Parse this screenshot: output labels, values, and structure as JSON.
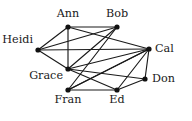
{
  "figure": {
    "background_color": "#ffffff",
    "edge_color": "#1a1a1a",
    "vertex_color": "#111111",
    "label_color": "#1a1a1a"
  },
  "chart_data": {
    "type": "diagram",
    "subtype": "node-link-graph",
    "directed": false,
    "title": "",
    "xlabel": "",
    "ylabel": "",
    "grid": false,
    "legend": "none",
    "nodes": [
      {
        "id": "ann",
        "label": "Ann",
        "x": 68,
        "y": 27,
        "label_x": 68,
        "label_y": 17,
        "label_anchor": "middle"
      },
      {
        "id": "bob",
        "label": "Bob",
        "x": 117,
        "y": 27,
        "label_x": 117,
        "label_y": 17,
        "label_anchor": "middle"
      },
      {
        "id": "heidi",
        "label": "Heidi",
        "x": 38,
        "y": 50,
        "label_x": 33,
        "label_y": 43,
        "label_anchor": "end"
      },
      {
        "id": "cal",
        "label": "Cal",
        "x": 149,
        "y": 49,
        "label_x": 155,
        "label_y": 52,
        "label_anchor": "start"
      },
      {
        "id": "grace",
        "label": "Grace",
        "x": 68,
        "y": 69,
        "label_x": 63,
        "label_y": 79,
        "label_anchor": "end"
      },
      {
        "id": "don",
        "label": "Don",
        "x": 145,
        "y": 79,
        "label_x": 152,
        "label_y": 82,
        "label_anchor": "start"
      },
      {
        "id": "fran",
        "label": "Fran",
        "x": 68,
        "y": 90,
        "label_x": 68,
        "label_y": 103,
        "label_anchor": "middle"
      },
      {
        "id": "ed",
        "label": "Ed",
        "x": 117,
        "y": 90,
        "label_x": 117,
        "label_y": 103,
        "label_anchor": "middle"
      }
    ],
    "edges": [
      {
        "source": "ann",
        "target": "bob"
      },
      {
        "source": "ann",
        "target": "heidi"
      },
      {
        "source": "ann",
        "target": "cal"
      },
      {
        "source": "ann",
        "target": "grace"
      },
      {
        "source": "bob",
        "target": "heidi"
      },
      {
        "source": "bob",
        "target": "grace"
      },
      {
        "source": "bob",
        "target": "fran"
      },
      {
        "source": "heidi",
        "target": "grace"
      },
      {
        "source": "heidi",
        "target": "cal"
      },
      {
        "source": "cal",
        "target": "grace"
      },
      {
        "source": "cal",
        "target": "don"
      },
      {
        "source": "cal",
        "target": "fran"
      },
      {
        "source": "cal",
        "target": "ed"
      },
      {
        "source": "grace",
        "target": "ed"
      },
      {
        "source": "grace",
        "target": "don"
      },
      {
        "source": "fran",
        "target": "ed"
      },
      {
        "source": "fran",
        "target": "cal"
      },
      {
        "source": "ed",
        "target": "don"
      }
    ],
    "node_count": 8,
    "edge_count": 18,
    "vertex_radius": 2.6
  }
}
